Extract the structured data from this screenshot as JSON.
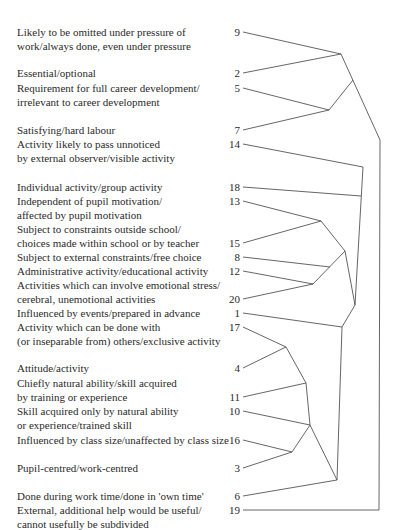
{
  "figure": {
    "type": "dendrogram",
    "leaves": [
      {
        "id": "9",
        "lines": [
          "Likely to be omitted under pressure of",
          "work/always done, even under pressure"
        ],
        "label_y": 25,
        "num_y": 25
      },
      {
        "id": "2",
        "lines": [
          "Essential/optional"
        ],
        "label_y": 66,
        "num_y": 66
      },
      {
        "id": "5",
        "lines": [
          "Requirement for full career development/",
          "irrelevant to career development"
        ],
        "label_y": 81,
        "num_y": 81
      },
      {
        "id": "7",
        "lines": [
          "Satisfying/hard labour"
        ],
        "label_y": 123,
        "num_y": 123
      },
      {
        "id": "14",
        "lines": [
          "Activity likely to pass unnoticed",
          "by external observer/visible activity"
        ],
        "label_y": 137,
        "num_y": 137
      },
      {
        "id": "18",
        "lines": [
          "Individual activity/group activity"
        ],
        "label_y": 180,
        "num_y": 180
      },
      {
        "id": "13",
        "lines": [
          "Independent of pupil motivation/",
          "affected by pupil motivation"
        ],
        "label_y": 194,
        "num_y": 194
      },
      {
        "id": "15",
        "lines": [
          "Subject to constraints outside school/",
          "choices made within school or by teacher"
        ],
        "label_y": 222,
        "num_y": 236
      },
      {
        "id": "8",
        "lines": [
          "Subject to external constraints/free choice"
        ],
        "label_y": 250,
        "num_y": 250
      },
      {
        "id": "12",
        "lines": [
          "Administrative activity/educational activity"
        ],
        "label_y": 264,
        "num_y": 264
      },
      {
        "id": "20",
        "lines": [
          "Activities which can involve emotional stress/",
          "cerebral, unemotional activities"
        ],
        "label_y": 278,
        "num_y": 292
      },
      {
        "id": "1",
        "lines": [
          "Influenced by events/prepared in advance"
        ],
        "label_y": 306,
        "num_y": 306
      },
      {
        "id": "17",
        "lines": [
          "Activity which can be done with",
          "(or inseparable from) others/exclusive activity"
        ],
        "label_y": 320,
        "num_y": 320
      },
      {
        "id": "4",
        "lines": [
          "Attitude/activity"
        ],
        "label_y": 361,
        "num_y": 361
      },
      {
        "id": "11",
        "lines": [
          "Chiefly natural ability/skill acquired",
          "by training or experience"
        ],
        "label_y": 376,
        "num_y": 390
      },
      {
        "id": "10",
        "lines": [
          "Skill acquired only by natural ability",
          "or experience/trained skill"
        ],
        "label_y": 404,
        "num_y": 404
      },
      {
        "id": "16",
        "lines": [
          "Influenced by class size/unaffected by class size"
        ],
        "label_y": 433,
        "num_y": 433
      },
      {
        "id": "3",
        "lines": [
          "Pupil-centred/work-centred"
        ],
        "label_y": 461,
        "num_y": 461
      },
      {
        "id": "6",
        "lines": [
          "Done during work time/done in 'own time'"
        ],
        "label_y": 489,
        "num_y": 489
      },
      {
        "id": "19",
        "lines": [
          "External, additional help would be useful/",
          "cannot usefully be subdivided"
        ],
        "label_y": 503,
        "num_y": 503
      }
    ],
    "line_color": "#555555",
    "text_color": "#2a2a2a"
  }
}
